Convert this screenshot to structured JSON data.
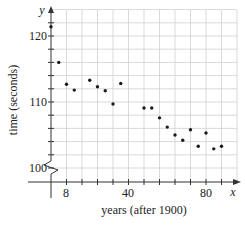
{
  "chart_data": {
    "type": "scatter",
    "title": "",
    "xlabel": "years (after 1900)",
    "ylabel": "time (seconds)",
    "x_axis_var": "x",
    "y_axis_var": "y",
    "xlim": [
      0,
      96
    ],
    "ylim": [
      100,
      124
    ],
    "axis_break_y": true,
    "grid": true,
    "x_ticks": [
      8,
      16,
      24,
      32,
      40,
      48,
      56,
      64,
      72,
      80,
      88
    ],
    "x_tick_labels": {
      "8": "8",
      "40": "40",
      "80": "80"
    },
    "y_ticks": [
      100,
      102,
      104,
      106,
      108,
      110,
      112,
      114,
      116,
      118,
      120,
      122
    ],
    "y_tick_labels": {
      "100": "100",
      "110": "110",
      "120": "120"
    },
    "points": [
      {
        "x": 0,
        "y": 121.4
      },
      {
        "x": 4,
        "y": 116.0
      },
      {
        "x": 8,
        "y": 112.7
      },
      {
        "x": 12,
        "y": 111.8
      },
      {
        "x": 20,
        "y": 113.3
      },
      {
        "x": 24,
        "y": 112.3
      },
      {
        "x": 28,
        "y": 111.7
      },
      {
        "x": 32,
        "y": 109.7
      },
      {
        "x": 36,
        "y": 112.8
      },
      {
        "x": 48,
        "y": 109.1
      },
      {
        "x": 52,
        "y": 109.1
      },
      {
        "x": 56,
        "y": 107.6
      },
      {
        "x": 60,
        "y": 106.2
      },
      {
        "x": 64,
        "y": 105.0
      },
      {
        "x": 68,
        "y": 104.2
      },
      {
        "x": 72,
        "y": 105.8
      },
      {
        "x": 76,
        "y": 103.3
      },
      {
        "x": 80,
        "y": 105.3
      },
      {
        "x": 84,
        "y": 102.9
      },
      {
        "x": 88,
        "y": 103.3
      }
    ]
  },
  "labels": {
    "xlabel": "years (after 1900)",
    "ylabel": "time (seconds)",
    "x_var": "x",
    "y_var": "y",
    "x_tick_8": "8",
    "x_tick_40": "40",
    "x_tick_80": "80",
    "y_tick_100": "100",
    "y_tick_110": "110",
    "y_tick_120": "120"
  },
  "colors": {
    "grid": "#cfcfcf",
    "axis": "#333333",
    "point": "#1a1a1a"
  }
}
